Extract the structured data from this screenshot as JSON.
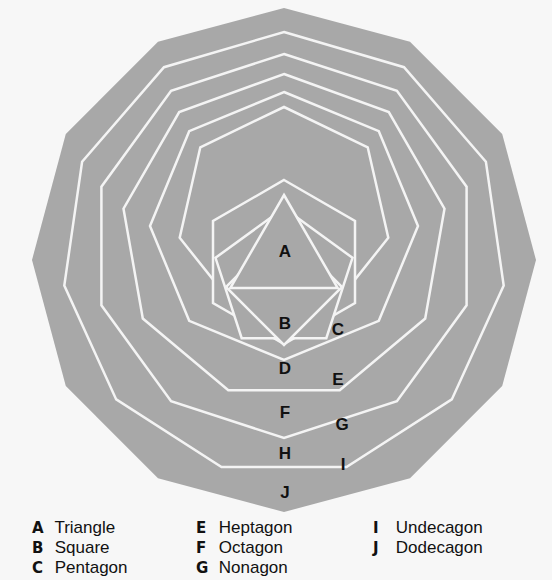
{
  "diagram": {
    "title": "",
    "fill_color": "#a8a8a8",
    "line_color": "#f4f4f4",
    "background": "#f7f7f7",
    "regions": [
      {
        "letter": "A",
        "x": 285,
        "y": 257
      },
      {
        "letter": "B",
        "x": 285,
        "y": 329
      },
      {
        "letter": "C",
        "x": 338,
        "y": 335
      },
      {
        "letter": "D",
        "x": 285,
        "y": 374
      },
      {
        "letter": "E",
        "x": 338,
        "y": 385
      },
      {
        "letter": "F",
        "x": 285,
        "y": 418
      },
      {
        "letter": "G",
        "x": 342,
        "y": 430
      },
      {
        "letter": "H",
        "x": 285,
        "y": 459
      },
      {
        "letter": "I",
        "x": 343,
        "y": 470
      },
      {
        "letter": "J",
        "x": 285,
        "y": 498
      }
    ]
  },
  "legend": {
    "col1": [
      {
        "letter": "A",
        "name": "Triangle"
      },
      {
        "letter": "B",
        "name": "Square"
      },
      {
        "letter": "C",
        "name": "Pentagon"
      },
      {
        "letter": "D",
        "name": "Hexagon"
      }
    ],
    "col2": [
      {
        "letter": "E",
        "name": "Heptagon"
      },
      {
        "letter": "F",
        "name": "Octagon"
      },
      {
        "letter": "G",
        "name": "Nonagon"
      }
    ],
    "col3": [
      {
        "letter": "I",
        "name": "Undecagon"
      },
      {
        "letter": "J",
        "name": "Dodecagon"
      }
    ]
  }
}
